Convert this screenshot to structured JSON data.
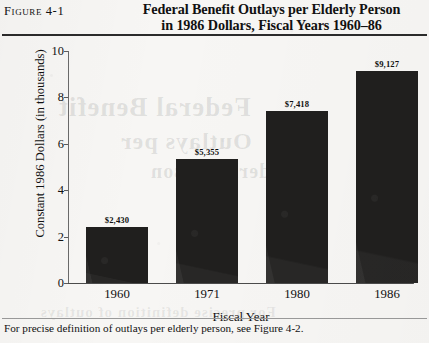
{
  "figure": {
    "number_label": "Figure 4-1",
    "title_line_1": "Federal Benefit Outlays per Elderly Person",
    "title_line_2": "in 1986 Dollars, Fiscal Years 1960–86",
    "note": "For precise definition of outlays per elderly person, see Figure 4-2."
  },
  "bleed_through": {
    "line_1": "Federal Benefit",
    "line_2": "Outlays per",
    "line_3": "Elderly Person",
    "line_4": "For precise definition of outlays"
  },
  "colors": {
    "paper": "#f7f6f4",
    "bar_fill": "#201f1e",
    "axis": "#4b4b4b",
    "rule_top": "#2b2b2b",
    "rule_bottom": "#9a9a9a",
    "text": "#111111"
  },
  "chart_data": {
    "type": "bar",
    "title": "Federal Benefit Outlays per Elderly Person in 1986 Dollars, Fiscal Years 1960–86",
    "xlabel": "Fiscal Year",
    "ylabel": "Constant 1986 Dollars (in thousands)",
    "categories": [
      "1960",
      "1971",
      "1980",
      "1986"
    ],
    "values": [
      2.43,
      5.355,
      7.418,
      9.127
    ],
    "value_labels": [
      "$2,430",
      "$5,355",
      "$7,418",
      "$9,127"
    ],
    "ylim": [
      0,
      10
    ],
    "yticks": [
      0,
      2,
      4,
      6,
      8,
      10
    ],
    "ytick_labels": [
      "0",
      "2",
      "4",
      "6",
      "8",
      "10"
    ],
    "grid": false,
    "legend": null,
    "units": "thousands of constant 1986 dollars"
  }
}
